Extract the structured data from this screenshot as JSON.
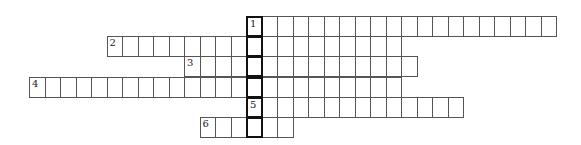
{
  "puzzle": {
    "type": "crossword",
    "cell_width": 15.5,
    "cell_height": 20.2,
    "origin_x": 246,
    "origin_y": 16,
    "highlight_column_label": "vertical keyword column",
    "rows": [
      {
        "number": "1",
        "offset": 0,
        "length": 20
      },
      {
        "number": "2",
        "offset": -9,
        "length": 19
      },
      {
        "number": "3",
        "offset": -4,
        "length": 15
      },
      {
        "number": "4",
        "offset": -14,
        "length": 24
      },
      {
        "number": "5",
        "offset": 0,
        "length": 14
      },
      {
        "number": "6",
        "offset": -3,
        "length": 6
      }
    ]
  }
}
